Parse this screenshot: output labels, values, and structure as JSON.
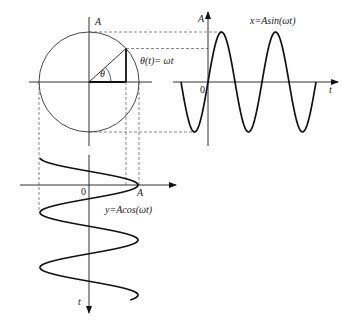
{
  "figure": {
    "type": "phasor-projection-diagram",
    "circle": {
      "center": [
        89,
        82
      ],
      "radius": 50,
      "angle_deg": 42,
      "axis_label": "A",
      "angle_label": "θ",
      "angle_equation": "θ(t)= ωt"
    },
    "sine_plot": {
      "origin": [
        208,
        82
      ],
      "amplitude_px": 50,
      "period_px": 54,
      "x_start": 181,
      "x_end": 316,
      "y_axis_label": "A",
      "x_axis_label": "t",
      "origin_label": "0",
      "equation": "x=Asin(ωt)"
    },
    "cosine_plot": {
      "origin": [
        89,
        185
      ],
      "amplitude_px": 49,
      "period_px": 55,
      "y_start": 158,
      "y_end": 300,
      "axis_end_label": "A",
      "time_axis_label": "t",
      "origin_label": "0",
      "equation": "y=Acos(ωt)"
    }
  },
  "labels": {
    "circle_A": "A",
    "theta": "θ",
    "theta_eq": "θ(t)= ωt",
    "sine_A": "A",
    "sine_eq": "x=Asin(ωt)",
    "sine_zero": "0",
    "sine_t": "t",
    "cos_zero": "0",
    "cos_A": "A",
    "cos_eq": "y=Acos(ωt)",
    "cos_t": "t"
  },
  "colors": {
    "background": "#ffffff",
    "ink": "#111111",
    "dash": "#555555"
  }
}
